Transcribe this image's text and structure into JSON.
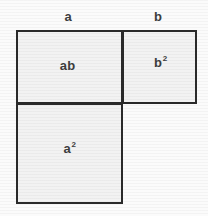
{
  "figure": {
    "type": "geometric-area-diagram",
    "background_color": "#fbfbfb",
    "fill_color": "#f2f2f2",
    "border_color": "#2a2a2a",
    "text_color": "#3d3d3d"
  },
  "dimension_labels": {
    "a": "a",
    "b": "b"
  },
  "regions": {
    "ab": {
      "label_base": "ab",
      "label_sup": ""
    },
    "b_squared": {
      "label_base": "b",
      "label_sup": "2"
    },
    "a_squared": {
      "label_base": "a",
      "label_sup": "2"
    }
  }
}
